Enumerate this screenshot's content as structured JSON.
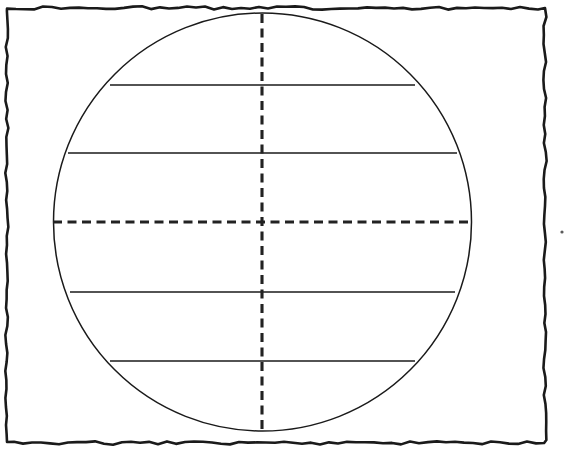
{
  "figure": {
    "title": "Sphere diagram with latitude chords and dashed center axes",
    "caption": "",
    "background_color": "#ffffff",
    "ink_color": "#1a1a1a",
    "axis_color": "#222222",
    "canvas": {
      "width": 575,
      "height": 449
    }
  },
  "frame": {
    "name": "hand-drawn wavy rectangular border",
    "stroke_color": "#1a1a1a",
    "stroke_width": 2.6,
    "left": 7,
    "top": 8,
    "right": 545,
    "bottom": 443,
    "style": "wavy"
  },
  "chart_data": {
    "type": "line",
    "title": "Sphere diagram with latitude chords and dashed center axes",
    "xlabel": "",
    "ylabel": "",
    "grid": false,
    "legend": "none",
    "xlim": [
      0,
      575
    ],
    "ylim": [
      449,
      0
    ],
    "circle": {
      "label": "sphere-outline",
      "center_x": 262.5,
      "center_y": 222,
      "radius": 209,
      "left": 53,
      "right": 472,
      "top": 14,
      "bottom": 430,
      "stroke": "solid",
      "stroke_width": 1.5
    },
    "series": [
      {
        "name": "latitude-chord-1",
        "style": "solid",
        "y": 85,
        "x_start": 110,
        "x_end": 415,
        "half_width": 152
      },
      {
        "name": "latitude-chord-2",
        "style": "solid",
        "y": 153,
        "x_start": 68,
        "x_end": 457,
        "half_width": 194
      },
      {
        "name": "equator-axis-horizontal",
        "style": "dashed",
        "y": 222,
        "x_start": 53,
        "x_end": 472,
        "half_width": 209
      },
      {
        "name": "latitude-chord-3",
        "style": "solid",
        "y": 292,
        "x_start": 70,
        "x_end": 455,
        "half_width": 192
      },
      {
        "name": "latitude-chord-4",
        "style": "solid",
        "y": 361,
        "x_start": 110,
        "x_end": 415,
        "half_width": 152
      },
      {
        "name": "meridian-axis-vertical",
        "style": "dashed",
        "x": 262,
        "y_start": 14,
        "y_end": 430
      }
    ],
    "dash_pattern": {
      "dash": 9,
      "gap": 5.5
    }
  },
  "marks": [
    {
      "name": "stray-dot",
      "x": 562,
      "y": 232,
      "radius": 1.6,
      "color": "#5a5a5a"
    }
  ]
}
